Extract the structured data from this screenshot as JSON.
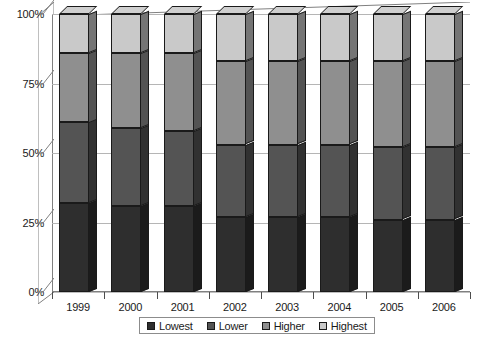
{
  "chart_data": {
    "type": "bar",
    "stacked": true,
    "stack_mode": "percent",
    "title": "",
    "subtitle": "",
    "xlabel": "",
    "ylabel": "",
    "categories": [
      "1999",
      "2000",
      "2001",
      "2002",
      "2003",
      "2004",
      "2005",
      "2006"
    ],
    "series": [
      {
        "name": "Lowest",
        "color": "#2e2e2e",
        "values": [
          32,
          31,
          31,
          27,
          27,
          27,
          26,
          26
        ]
      },
      {
        "name": "Lower",
        "color": "#545454",
        "values": [
          29,
          28,
          27,
          26,
          26,
          26,
          26,
          26
        ]
      },
      {
        "name": "Higher",
        "color": "#8f8f8f",
        "values": [
          25,
          27,
          28,
          30,
          30,
          30,
          31,
          31
        ]
      },
      {
        "name": "Highest",
        "color": "#c9c9c9",
        "values": [
          14,
          14,
          14,
          17,
          17,
          17,
          17,
          17
        ]
      }
    ],
    "y_ticks": [
      {
        "value": 0,
        "label": "0%"
      },
      {
        "value": 25,
        "label": "25%"
      },
      {
        "value": 50,
        "label": "50%"
      },
      {
        "value": 75,
        "label": "75%"
      },
      {
        "value": 100,
        "label": "100%"
      }
    ],
    "ylim": [
      0,
      100
    ],
    "grid": true,
    "legend_position": "bottom",
    "legend_entries": [
      "Lowest",
      "Lower",
      "Higher",
      "Highest"
    ],
    "style": {
      "three_d": true,
      "background": "#ffffff",
      "gridline_color": "#b5b5b5",
      "axis_color": "#808080",
      "text_color": "#1a1a1a",
      "bar_outline": "#1a1a1a"
    }
  }
}
